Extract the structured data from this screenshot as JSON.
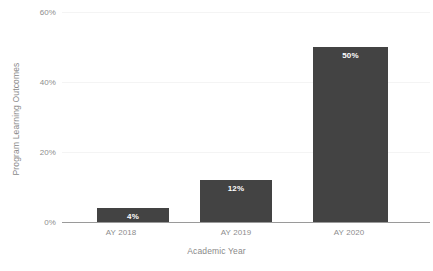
{
  "chart_data": {
    "type": "bar",
    "title": "",
    "subtitle": "",
    "categories": [
      "AY 2018",
      "AY 2019",
      "AY 2020"
    ],
    "values": [
      4,
      12,
      50
    ],
    "value_labels": [
      "4%",
      "12%",
      "50%"
    ],
    "xlabel": "Academic Year",
    "ylabel": "Program Learning Outcomes",
    "ylim": [
      0,
      60
    ],
    "ytick_values": [
      0,
      20,
      40,
      60
    ],
    "ytick_labels": [
      "0%",
      "20%",
      "40%",
      "60%"
    ],
    "grid": true,
    "legend": false,
    "legend_position": "none",
    "bar_color": "#434343",
    "value_label_color": "#ffffff",
    "tick_label_color": "#8d8d8d",
    "axis_title_color": "#8a8a8a",
    "gridline_color": "#f4f4f4",
    "baseline_color": "#9a9a9a",
    "background_color": "#ffffff"
  }
}
